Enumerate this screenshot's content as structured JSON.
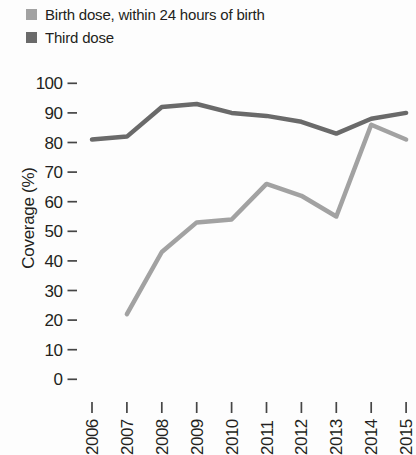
{
  "legend": {
    "items": [
      {
        "label": "Birth dose, within 24 hours of birth",
        "color": "#a2a2a2"
      },
      {
        "label": "Third dose",
        "color": "#6a6a6a"
      }
    ]
  },
  "chart_data": {
    "type": "line",
    "title": "",
    "ylabel": "Coverage (%)",
    "xlabel": "",
    "x": [
      2006,
      2007,
      2008,
      2009,
      2010,
      2011,
      2012,
      2013,
      2014,
      2015
    ],
    "series": [
      {
        "name": "Birth dose, within 24 hours of birth",
        "color": "#a2a2a2",
        "values": [
          null,
          22,
          43,
          53,
          54,
          66,
          62,
          55,
          86,
          81
        ]
      },
      {
        "name": "Third dose",
        "color": "#6a6a6a",
        "values": [
          81,
          82,
          92,
          93,
          90,
          89,
          87,
          83,
          88,
          90
        ]
      }
    ],
    "ylim": [
      0,
      100
    ],
    "yticks": [
      0,
      10,
      20,
      30,
      40,
      50,
      60,
      70,
      80,
      90,
      100
    ],
    "grid": false,
    "legend_position": "top-left",
    "text_color": "#231f20",
    "tick_color": "#454545"
  }
}
